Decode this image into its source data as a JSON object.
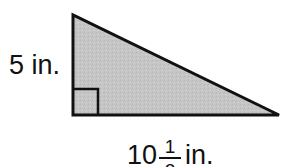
{
  "figure": {
    "type": "right-triangle",
    "fill_color": "#c8c8c8",
    "stroke_color": "#111111",
    "vertices": {
      "top": [
        73,
        15
      ],
      "bottom_left": [
        73,
        115
      ],
      "bottom_right": [
        279,
        115
      ]
    },
    "right_angle_marker": {
      "x": 73,
      "y": 89,
      "size": 25
    }
  },
  "labels": {
    "height": {
      "value": "5",
      "unit": "in.",
      "text": "5 in."
    },
    "base": {
      "whole": "10",
      "numerator": "1",
      "denominator": "2",
      "unit": "in.",
      "text": "10 1/2 in."
    }
  }
}
